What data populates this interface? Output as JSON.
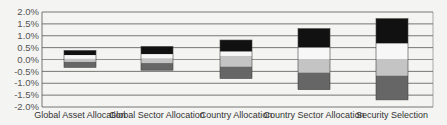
{
  "chart_data": {
    "type": "bar",
    "stacked": true,
    "title": "",
    "xlabel": "",
    "ylabel": "",
    "ylim": [
      -2.0,
      2.0
    ],
    "y_ticks": [
      "2.0%",
      "1.5%",
      "1.0%",
      "0.5%",
      "0.0%",
      "-0.5%",
      "-1.0%",
      "-1.5%",
      "-2.0%"
    ],
    "grid": true,
    "legend": "none",
    "categories": [
      "Global Asset Allocation",
      "Global Sector Allocation",
      "Country Allocation",
      "Country Sector Allocation",
      "Security Selection"
    ],
    "segments_note": "Stacked bands per bar from top to bottom: black, white, light gray, dark gray; values are band boundaries in %",
    "series": [
      {
        "name": "black band",
        "color": "#111111",
        "top": [
          0.38,
          0.55,
          0.82,
          1.3,
          1.72
        ],
        "bottom": [
          0.18,
          0.22,
          0.33,
          0.5,
          0.67
        ]
      },
      {
        "name": "white band",
        "color": "#f7f7f7",
        "top": [
          0.18,
          0.22,
          0.33,
          0.5,
          0.67
        ],
        "bottom": [
          0.03,
          0.05,
          0.15,
          0.0,
          0.0
        ]
      },
      {
        "name": "light gray band",
        "color": "#c4c4c4",
        "top": [
          0.03,
          0.05,
          0.15,
          0.0,
          0.0
        ],
        "bottom": [
          -0.1,
          -0.15,
          -0.3,
          -0.55,
          -0.68
        ]
      },
      {
        "name": "dark gray band",
        "color": "#666666",
        "top": [
          -0.1,
          -0.15,
          -0.3,
          -0.55,
          -0.68
        ],
        "bottom": [
          -0.33,
          -0.45,
          -0.8,
          -1.27,
          -1.7
        ]
      }
    ]
  }
}
